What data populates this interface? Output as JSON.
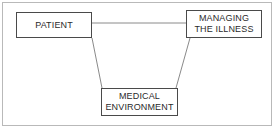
{
  "diagram": {
    "background_color": "#ffffff",
    "frame": {
      "label": "diagram-frame",
      "border_color": "#b9b9b9"
    },
    "nodes": [
      {
        "id": "patient",
        "label": "PATIENT",
        "border_color": "#4a4a4a",
        "fill_color": "#ffffff",
        "text_color": "#2b2b2b"
      },
      {
        "id": "managing-illness",
        "label": "MANAGING\nTHE ILLNESS",
        "border_color": "#4a4a4a",
        "fill_color": "#ffffff",
        "text_color": "#2b2b2b"
      },
      {
        "id": "medical-environment",
        "label": "MEDICAL\nENVIRONMENT",
        "border_color": "#4a4a4a",
        "fill_color": "#ffffff",
        "text_color": "#2b2b2b"
      }
    ],
    "connectors": [
      {
        "id": "patient-to-managing-illness",
        "from": "patient",
        "to": "managing-illness",
        "style": "straight",
        "color": "#8a8a8a"
      },
      {
        "id": "patient-to-medical-environment",
        "from": "patient",
        "to": "medical-environment",
        "style": "diagonal",
        "color": "#8a8a8a"
      },
      {
        "id": "managing-illness-to-medical-environment",
        "from": "managing-illness",
        "to": "medical-environment",
        "style": "diagonal",
        "color": "#8a8a8a"
      }
    ]
  }
}
